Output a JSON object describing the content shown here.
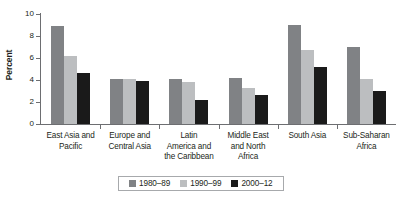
{
  "chart_data": {
    "type": "bar",
    "title": "",
    "xlabel": "",
    "ylabel": "Percent",
    "ylim": [
      0,
      10
    ],
    "yticks": [
      0,
      2,
      4,
      6,
      8,
      10
    ],
    "ytick_labels": [
      "0",
      "2",
      "4",
      "6",
      "8",
      "10"
    ],
    "grid": false,
    "legend_position": "bottom",
    "categories": [
      "East Asia and Pacific",
      "Europe and Central Asia",
      "Latin America and the Caribbean",
      "Middle East and North Africa",
      "South Asia",
      "Sub-Saharan Africa"
    ],
    "category_lines": [
      [
        "East Asia and",
        "Pacific"
      ],
      [
        "Europe and",
        "Central Asia"
      ],
      [
        "Latin",
        "America and",
        "the Caribbean"
      ],
      [
        "Middle East",
        "and North",
        "Africa"
      ],
      [
        "South Asia"
      ],
      [
        "Sub-Saharan",
        "Africa"
      ]
    ],
    "series": [
      {
        "name": "1980–89",
        "color": "#808285",
        "values": [
          8.9,
          4.1,
          4.1,
          4.2,
          9.0,
          7.0
        ]
      },
      {
        "name": "1990–99",
        "color": "#bcbec0",
        "values": [
          6.2,
          4.1,
          3.8,
          3.3,
          6.7,
          4.1
        ]
      },
      {
        "name": "2000–12",
        "color": "#1a1a1a",
        "values": [
          4.6,
          3.95,
          2.2,
          2.6,
          5.2,
          3.0
        ]
      }
    ]
  },
  "colors": {
    "series_1980_89": "#808285",
    "series_1990_99": "#bcbec0",
    "series_2000_12": "#1a1a1a",
    "axis": "#6d6e71",
    "text": "#231f20",
    "background": "#ffffff"
  }
}
